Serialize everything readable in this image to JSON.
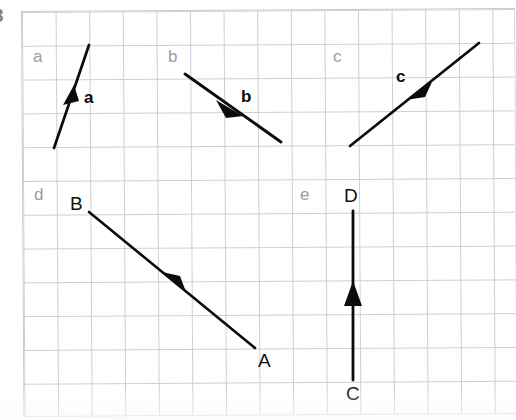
{
  "page": {
    "width": 516,
    "height": 420,
    "background": "#ffffff",
    "corner_mark": "3",
    "paper": {
      "kind": "graph-paper",
      "line_color": "#c9ccd4",
      "cell_size_px": 33.7,
      "origin_x": 21,
      "origin_y": 11,
      "cols": 14,
      "rows": 12,
      "skew_deg": -0.35
    }
  },
  "stroke": {
    "color": "#0b0b0b",
    "width": 2.6,
    "arrow_fill": "#0b0b0b"
  },
  "diagram_data": {
    "type": "vector-diagram",
    "title": "",
    "description": "Five hand-drawn vectors on graph paper, each in its own labelled region.",
    "panels": [
      {
        "id": "a",
        "panel_label": "a",
        "panel_label_pos": {
          "x": 33,
          "y": 48
        },
        "vector_label": "a",
        "vector_label_pos": {
          "x": 84,
          "y": 89
        },
        "tail": {
          "x": 54,
          "y": 148
        },
        "head": {
          "x": 89,
          "y": 45
        },
        "arrow_at": {
          "x": 72,
          "y": 96
        },
        "arrow_placement": "midpoint",
        "direction": "up-right",
        "components_cells": {
          "dx": 1,
          "dy": -3
        }
      },
      {
        "id": "b",
        "panel_label": "b",
        "panel_label_pos": {
          "x": 168,
          "y": 48
        },
        "vector_label": "b",
        "vector_label_pos": {
          "x": 241,
          "y": 88
        },
        "tail": {
          "x": 185,
          "y": 74
        },
        "head": {
          "x": 281,
          "y": 142
        },
        "arrow_at": {
          "x": 234,
          "y": 108
        },
        "arrow_placement": "midpoint",
        "direction": "down-right",
        "components_cells": {
          "dx": 3,
          "dy": 2
        }
      },
      {
        "id": "c",
        "panel_label": "c",
        "panel_label_pos": {
          "x": 333,
          "y": 48
        },
        "vector_label": "c",
        "vector_label_pos": {
          "x": 396,
          "y": 68
        },
        "tail": {
          "x": 479,
          "y": 43
        },
        "head": {
          "x": 350,
          "y": 146
        },
        "arrow_at": {
          "x": 418,
          "y": 92
        },
        "arrow_placement": "midpoint",
        "direction": "down-left",
        "components_cells": {
          "dx": -4,
          "dy": 3
        }
      },
      {
        "id": "d",
        "panel_label": "d",
        "panel_label_pos": {
          "x": 34,
          "y": 186
        },
        "vector_label": "",
        "vector_label_pos": null,
        "tail": {
          "x": 255,
          "y": 348
        },
        "head": {
          "x": 89,
          "y": 212
        },
        "arrow_at": {
          "x": 172,
          "y": 280
        },
        "arrow_placement": "midpoint",
        "direction": "up-left",
        "components_cells": {
          "dx": -5,
          "dy": -4
        },
        "endpoints": [
          {
            "name": "A",
            "x": 255,
            "y": 348,
            "label_pos": {
              "x": 258,
              "y": 351
            }
          },
          {
            "name": "B",
            "x": 89,
            "y": 212,
            "label_pos": {
              "x": 70,
              "y": 194
            }
          }
        ]
      },
      {
        "id": "e",
        "panel_label": "e",
        "panel_label_pos": {
          "x": 300,
          "y": 186
        },
        "vector_label": "",
        "vector_label_pos": null,
        "tail": {
          "x": 353,
          "y": 380
        },
        "head": {
          "x": 353,
          "y": 211
        },
        "arrow_at": {
          "x": 353,
          "y": 295
        },
        "arrow_placement": "midpoint",
        "direction": "up",
        "components_cells": {
          "dx": 0,
          "dy": -5
        },
        "endpoints": [
          {
            "name": "C",
            "x": 353,
            "y": 380,
            "label_pos": {
              "x": 346,
              "y": 384
            }
          },
          {
            "name": "D",
            "x": 353,
            "y": 211,
            "label_pos": {
              "x": 344,
              "y": 186
            }
          }
        ]
      }
    ]
  }
}
